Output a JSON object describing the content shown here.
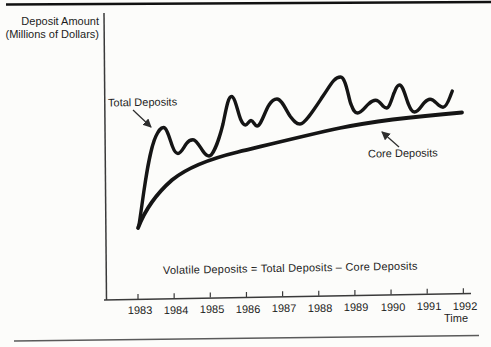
{
  "figure": {
    "y_axis_title_line1": "Deposit Amount",
    "y_axis_title_line2": "(Millions of Dollars)",
    "x_axis_title": "Time",
    "total_label": "Total Deposits",
    "core_label": "Core Deposits",
    "equation": "Volatile Deposits = Total Deposits – Core Deposits",
    "years": [
      "1983",
      "1984",
      "1985",
      "1986",
      "1987",
      "1988",
      "1989",
      "1990",
      "1991",
      "1992"
    ]
  },
  "colors": {
    "ink": "#151515",
    "axis": "#3a3a3a",
    "paper": "#fcfcfa",
    "top_rule": "#111111",
    "bottom_rule": "#5a5a5a"
  },
  "chart_data": {
    "type": "line",
    "title": "",
    "xlabel": "Time",
    "ylabel": "Deposit Amount (Millions of Dollars)",
    "x_tick_labels": [
      "1983",
      "1984",
      "1985",
      "1986",
      "1987",
      "1988",
      "1989",
      "1990",
      "1991",
      "1992"
    ],
    "x_range": [
      1983,
      1992
    ],
    "y_axis_scale": "unlabeled (conceptual sketch, relative units)",
    "grid": false,
    "legend_position": "inline arrow callouts",
    "annotation": "Volatile Deposits = Total Deposits – Core Deposits",
    "series": [
      {
        "name": "Total Deposits",
        "style": "irregular wavy hand-drawn line oscillating above the core curve",
        "points_year_value": [
          [
            1983.0,
            75
          ],
          [
            1983.7,
            173
          ],
          [
            1984.1,
            147
          ],
          [
            1984.5,
            160
          ],
          [
            1985.0,
            144
          ],
          [
            1985.6,
            204
          ],
          [
            1986.0,
            175
          ],
          [
            1986.2,
            180
          ],
          [
            1986.35,
            174
          ],
          [
            1986.9,
            201
          ],
          [
            1987.5,
            176
          ],
          [
            1988.6,
            223
          ],
          [
            1989.1,
            186
          ],
          [
            1989.6,
            200
          ],
          [
            1989.9,
            192
          ],
          [
            1990.3,
            215
          ],
          [
            1990.7,
            188
          ],
          [
            1991.2,
            201
          ],
          [
            1991.5,
            193
          ],
          [
            1991.8,
            209
          ]
        ]
      },
      {
        "name": "Core Deposits",
        "style": "smooth concave curve rising at a decreasing rate",
        "points_year_value": [
          [
            1983.0,
            72
          ],
          [
            1983.3,
            95
          ],
          [
            1984.0,
            124
          ],
          [
            1985.0,
            141
          ],
          [
            1986.0,
            151
          ],
          [
            1987.0,
            160
          ],
          [
            1988.0,
            169
          ],
          [
            1989.0,
            176
          ],
          [
            1990.0,
            181
          ],
          [
            1991.0,
            185
          ],
          [
            1992.0,
            188
          ]
        ]
      }
    ]
  }
}
